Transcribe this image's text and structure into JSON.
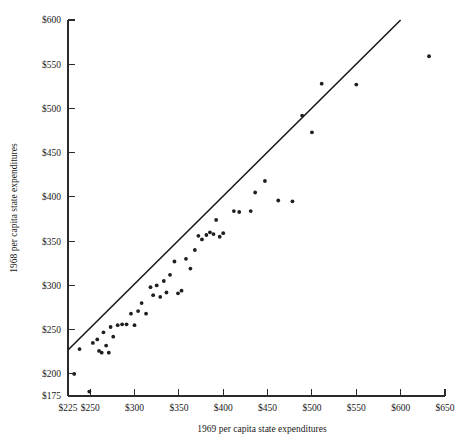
{
  "chart_data": {
    "type": "scatter",
    "title": "",
    "xlabel": "1969 per capita state expenditures",
    "ylabel": "1968 per capita state expenditures",
    "xlim": [
      225,
      650
    ],
    "ylim": [
      175,
      600
    ],
    "grid": false,
    "legend": null,
    "xtick_labels": [
      "$225",
      "$250",
      "$300",
      "$350",
      "$400",
      "$450",
      "$500",
      "$550",
      "$600",
      "$650"
    ],
    "xtick_values": [
      225,
      250,
      300,
      350,
      400,
      450,
      500,
      550,
      600,
      650
    ],
    "ytick_labels": [
      "$175",
      "$200",
      "$250",
      "$300",
      "$350",
      "$400",
      "$450",
      "$500",
      "$550",
      "$600"
    ],
    "ytick_values": [
      175,
      200,
      250,
      300,
      350,
      400,
      450,
      500,
      550,
      600
    ],
    "reference_line": {
      "name": "45-degree identity line",
      "x_start": 225,
      "y_start": 227,
      "x_end": 600,
      "y_end": 600,
      "color": "#1a1a1a"
    },
    "point_color": "#1f1f1f",
    "point_radius_px": 1.9,
    "points": [
      [
        232,
        200
      ],
      [
        238,
        228
      ],
      [
        249,
        180
      ],
      [
        253,
        235
      ],
      [
        258,
        239
      ],
      [
        260,
        226
      ],
      [
        263,
        224
      ],
      [
        265,
        247
      ],
      [
        268,
        232
      ],
      [
        271,
        224
      ],
      [
        273,
        253
      ],
      [
        276,
        242
      ],
      [
        281,
        255
      ],
      [
        286,
        256
      ],
      [
        291,
        256
      ],
      [
        296,
        268
      ],
      [
        300,
        255
      ],
      [
        304,
        271
      ],
      [
        308,
        280
      ],
      [
        313,
        268
      ],
      [
        318,
        298
      ],
      [
        321,
        289
      ],
      [
        325,
        300
      ],
      [
        329,
        287
      ],
      [
        333,
        305
      ],
      [
        336,
        292
      ],
      [
        340,
        312
      ],
      [
        345,
        327
      ],
      [
        349,
        291
      ],
      [
        353,
        294
      ],
      [
        358,
        330
      ],
      [
        363,
        319
      ],
      [
        368,
        340
      ],
      [
        372,
        356
      ],
      [
        376,
        352
      ],
      [
        381,
        357
      ],
      [
        385,
        360
      ],
      [
        389,
        358
      ],
      [
        392,
        374
      ],
      [
        396,
        355
      ],
      [
        400,
        359
      ],
      [
        412,
        384
      ],
      [
        418,
        383
      ],
      [
        431,
        384
      ],
      [
        436,
        405
      ],
      [
        447,
        418
      ],
      [
        462,
        396
      ],
      [
        478,
        395
      ],
      [
        489,
        492
      ],
      [
        500,
        473
      ],
      [
        511,
        528
      ],
      [
        550,
        527
      ],
      [
        632,
        559
      ]
    ]
  },
  "axes": {
    "y_axis_label": "1968 per capita state expenditures",
    "x_axis_label": "1969 per capita state expenditures"
  }
}
